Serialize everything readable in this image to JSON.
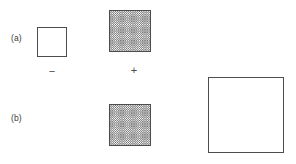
{
  "figure": {
    "background_color": "#ffffff",
    "line_color": "#4d4d4d",
    "hatch_color": "#6e6e6e",
    "text_color": "#3a3a3a",
    "width": 296,
    "height": 164
  },
  "panels": [
    {
      "label": "(a)",
      "label_x": 11,
      "label_y": 34,
      "squares": [
        {
          "name": "small-empty-square",
          "fill": "empty",
          "x": 37,
          "y": 27,
          "size": 30
        },
        {
          "name": "medium-hatched-square",
          "fill": "hatched",
          "x": 109,
          "y": 10,
          "size": 42
        }
      ]
    },
    {
      "label": "(b)",
      "label_x": 11,
      "label_y": 114,
      "squares": [
        {
          "name": "medium-hatched-square",
          "fill": "hatched",
          "x": 109,
          "y": 104,
          "size": 42
        },
        {
          "name": "large-empty-square",
          "fill": "empty",
          "x": 208,
          "y": 77,
          "size": 76
        }
      ]
    }
  ],
  "conditions": [
    {
      "name": "minus",
      "symbol": "−",
      "x": 44,
      "y": 66,
      "width": 16
    },
    {
      "name": "plus",
      "symbol": "+",
      "x": 126,
      "y": 65,
      "width": 16
    }
  ]
}
